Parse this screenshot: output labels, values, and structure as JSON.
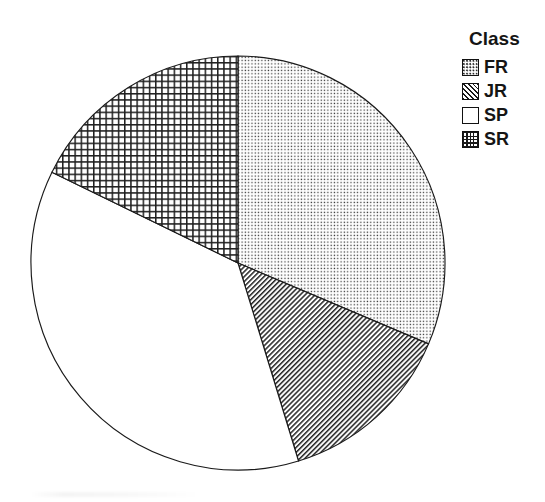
{
  "legend": {
    "title": "Class",
    "items": [
      {
        "label": "FR",
        "pattern": "dots",
        "swatch_name": "legend-swatch-fr"
      },
      {
        "label": "JR",
        "pattern": "diag",
        "swatch_name": "legend-swatch-jr"
      },
      {
        "label": "SP",
        "pattern": "blank",
        "swatch_name": "legend-swatch-sp"
      },
      {
        "label": "SR",
        "pattern": "grid",
        "swatch_name": "legend-swatch-sr"
      }
    ]
  },
  "chart_data": {
    "type": "pie",
    "title": "",
    "legend_title": "Class",
    "legend_position": "right",
    "grid": false,
    "categories": [
      "FR",
      "JR",
      "SP",
      "SR"
    ],
    "values": [
      31.4,
      13.9,
      36.9,
      17.8
    ],
    "units": "percent",
    "start_angle_deg": 0,
    "direction": "clockwise",
    "slices": [
      {
        "label": "FR",
        "value": 31.4,
        "start_angle_deg": 0.0,
        "end_angle_deg": 113.0,
        "fill": "dotted-stipple",
        "stroke": "#1a1a1a"
      },
      {
        "label": "JR",
        "value": 13.9,
        "start_angle_deg": 113.0,
        "end_angle_deg": 163.0,
        "fill": "diagonal-hatch",
        "stroke": "#1a1a1a"
      },
      {
        "label": "SP",
        "value": 36.9,
        "start_angle_deg": 163.0,
        "end_angle_deg": 296.0,
        "fill": "none-white",
        "stroke": "#1a1a1a"
      },
      {
        "label": "SR",
        "value": 17.8,
        "start_angle_deg": 296.0,
        "end_angle_deg": 360.0,
        "fill": "cross-hatch-grid",
        "stroke": "#1a1a1a"
      }
    ],
    "geometry": {
      "center_x": 238,
      "center_y": 263,
      "radius": 207
    },
    "colors": {
      "outline": "#1a1a1a",
      "background": "#ffffff",
      "pattern_ink": "#262626"
    }
  }
}
